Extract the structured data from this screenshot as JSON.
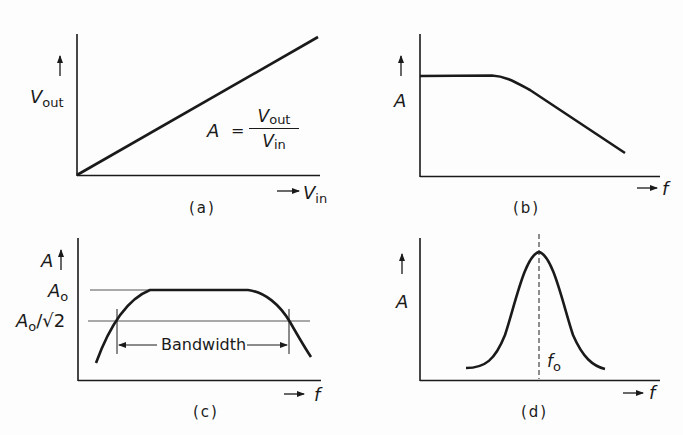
{
  "figure": {
    "panels": [
      {
        "id": "a",
        "caption": "(a)",
        "y_label": "V",
        "y_label_sub": "out",
        "x_label": "V",
        "x_label_sub": "in",
        "equation": {
          "lhs": "A",
          "eq": "=",
          "num": "V",
          "num_sub": "out",
          "den": "V",
          "den_sub": "in"
        },
        "curve": "linear, from origin"
      },
      {
        "id": "b",
        "caption": "(b)",
        "y_label": "A",
        "x_label": "f",
        "curve": "flat then roll-off (low-pass response)"
      },
      {
        "id": "c",
        "caption": "(c)",
        "y_label": "A",
        "x_label": "f",
        "level_high": "A",
        "level_high_sub": "o",
        "level_low": "A",
        "level_low_sub": "o",
        "level_low_suffix": "/√2",
        "bandwidth_label": "Bandwidth",
        "curve": "band-pass with flat top"
      },
      {
        "id": "d",
        "caption": "(d)",
        "y_label": "A",
        "x_label": "f",
        "center_label": "f",
        "center_label_sub": "o",
        "curve": "resonant peak at f0"
      }
    ],
    "colors": {
      "ink": "#1a1a1a",
      "background": "#fdfdfd",
      "thin_line": "#555555"
    }
  }
}
